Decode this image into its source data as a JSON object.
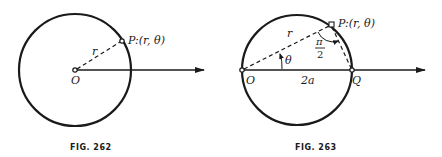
{
  "figures": [
    {
      "caption": "FIG. 262",
      "labels": {
        "point": "P:(r, θ)",
        "radius": "r",
        "origin": "O"
      }
    },
    {
      "caption": "FIG. 263",
      "labels": {
        "point": "P:(r, θ)",
        "radius": "r",
        "angle": "θ",
        "right_angle_num": "π",
        "right_angle_den": "2",
        "origin": "O",
        "diameter": "2a",
        "end": "Q"
      }
    }
  ],
  "colors": {
    "ink": "#1a1a1a",
    "background": "#ffffff"
  }
}
